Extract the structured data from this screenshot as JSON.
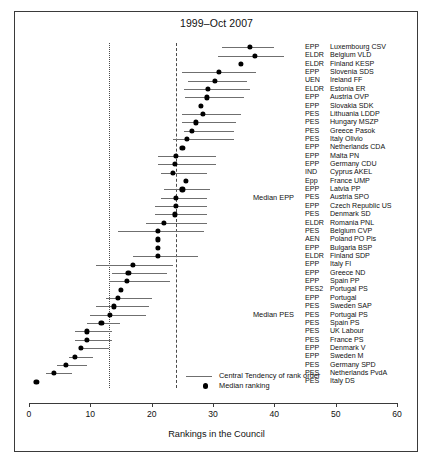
{
  "chart_data": {
    "type": "scatter",
    "title": "1999–Oct 2007",
    "xlabel": "Rankings in the Council",
    "ylabel": "",
    "xlim": [
      0,
      60
    ],
    "xticks": [
      0,
      10,
      20,
      30,
      40,
      50,
      60
    ],
    "grid": false,
    "legend_position": "bottom-center",
    "legend": [
      {
        "marker": "line",
        "label": "Central Tendency of rank order"
      },
      {
        "marker": "dot",
        "label": "Median ranking"
      }
    ],
    "reference_lines": [
      {
        "name": "Median PES",
        "value": 13,
        "style": "dotted"
      },
      {
        "name": "Median EPP",
        "value": 24,
        "style": "dashed"
      }
    ],
    "annotations": [
      {
        "text": "Median EPP",
        "row_index": 18
      },
      {
        "text": "Median PES",
        "row_index": 32
      }
    ],
    "series_names": [
      "Median ranking",
      "Central Tendency of rank order"
    ],
    "rows": [
      {
        "group": "EPP",
        "name": "Luxembourg CSV",
        "median": 36.0,
        "low": 31.5,
        "high": 40.0
      },
      {
        "group": "ELDR",
        "name": "Belgium VLD",
        "median": 36.8,
        "low": 30.8,
        "high": 41.5
      },
      {
        "group": "ELDR",
        "name": "Finland KESP",
        "median": 34.5,
        "low": 34.5,
        "high": 34.5
      },
      {
        "group": "EPP",
        "name": "Slovenia SDS",
        "median": 31.0,
        "low": 25.0,
        "high": 37.0
      },
      {
        "group": "UEN",
        "name": "Ireland FF",
        "median": 30.3,
        "low": 26.0,
        "high": 35.5
      },
      {
        "group": "ELDR",
        "name": "Estonia ER",
        "median": 29.2,
        "low": 25.2,
        "high": 36.0
      },
      {
        "group": "EPP",
        "name": "Austria OVP",
        "median": 29.0,
        "low": 25.5,
        "high": 35.0
      },
      {
        "group": "EPP",
        "name": "Slovakia SDK",
        "median": 28.0,
        "low": 28.0,
        "high": 28.0
      },
      {
        "group": "PES",
        "name": "Lithuania LDDP",
        "median": 28.3,
        "low": 25.0,
        "high": 34.5
      },
      {
        "group": "PES",
        "name": "Hungary MSZP",
        "median": 27.2,
        "low": 25.0,
        "high": 33.8
      },
      {
        "group": "PES",
        "name": "Greece Pasok",
        "median": 26.6,
        "low": 25.2,
        "high": 33.5
      },
      {
        "group": "PES",
        "name": "Italy Olivio",
        "median": 25.8,
        "low": 23.5,
        "high": 33.5
      },
      {
        "group": "EPP",
        "name": "Netherlands CDA",
        "median": 25.0,
        "low": 25.0,
        "high": 25.0
      },
      {
        "group": "EPP",
        "name": "Malta PN",
        "median": 24.0,
        "low": 21.0,
        "high": 30.5
      },
      {
        "group": "EPP",
        "name": "Germany CDU",
        "median": 23.8,
        "low": 21.0,
        "high": 30.5
      },
      {
        "group": "IND",
        "name": "Cyprus AKEL",
        "median": 23.4,
        "low": 21.5,
        "high": 29.0
      },
      {
        "group": "Epp",
        "name": "France UMP",
        "median": 25.6,
        "low": 25.6,
        "high": 25.6
      },
      {
        "group": "EPP",
        "name": "Latvia PP",
        "median": 25.0,
        "low": 22.0,
        "high": 29.5
      },
      {
        "group": "PES",
        "name": "Austria SPO",
        "median": 24.0,
        "low": 21.5,
        "high": 29.0
      },
      {
        "group": "EPP",
        "name": "Czech Republic US",
        "median": 24.0,
        "low": 20.5,
        "high": 29.0
      },
      {
        "group": "PES",
        "name": "Denmark SD",
        "median": 23.8,
        "low": 20.5,
        "high": 29.0
      },
      {
        "group": "ELDR",
        "name": "Romania PNL",
        "median": 22.0,
        "low": 19.0,
        "high": 29.0
      },
      {
        "group": "PES",
        "name": "Belgium CVP",
        "median": 21.0,
        "low": 14.5,
        "high": 28.5
      },
      {
        "group": "AEN",
        "name": "Poland PO Pis",
        "median": 21.0,
        "low": 21.0,
        "high": 21.0
      },
      {
        "group": "EPP",
        "name": "Bulgaria BSP",
        "median": 21.0,
        "low": 21.0,
        "high": 21.0
      },
      {
        "group": "ELDR",
        "name": "Finland SDP",
        "median": 21.0,
        "low": 17.0,
        "high": 27.5
      },
      {
        "group": "EPP",
        "name": "Italy FI",
        "median": 17.0,
        "low": 11.0,
        "high": 23.5
      },
      {
        "group": "EPP",
        "name": "Greece ND",
        "median": 16.2,
        "low": 13.5,
        "high": 22.5
      },
      {
        "group": "EPP",
        "name": "Spain PP",
        "median": 16.0,
        "low": 13.0,
        "high": 23.0
      },
      {
        "group": "PES2",
        "name": "Portugal PS",
        "median": 15.0,
        "low": 15.0,
        "high": 15.0
      },
      {
        "group": "EPP",
        "name": "Portugal",
        "median": 14.5,
        "low": 12.5,
        "high": 20.0
      },
      {
        "group": "PES",
        "name": "Sweden SAP",
        "median": 13.8,
        "low": 11.0,
        "high": 19.5
      },
      {
        "group": "PES",
        "name": "Portugal PS",
        "median": 13.2,
        "low": 10.0,
        "high": 19.0
      },
      {
        "group": "PES",
        "name": "Spain PS",
        "median": 11.8,
        "low": 9.5,
        "high": 14.8
      },
      {
        "group": "PES",
        "name": "UK Labour",
        "median": 9.5,
        "low": 7.5,
        "high": 13.5
      },
      {
        "group": "PES",
        "name": "France PS",
        "median": 9.5,
        "low": 7.5,
        "high": 13.5
      },
      {
        "group": "EPP",
        "name": "Denmark V",
        "median": 8.5,
        "low": 8.5,
        "high": 13.0
      },
      {
        "group": "EPP",
        "name": "Sweden M",
        "median": 7.5,
        "low": 6.5,
        "high": 10.5
      },
      {
        "group": "PES",
        "name": "Germany SPD",
        "median": 6.0,
        "low": 4.5,
        "high": 9.5
      },
      {
        "group": "PES",
        "name": "Netherlands PvdA",
        "median": 4.0,
        "low": 2.8,
        "high": 7.0
      },
      {
        "group": "PES",
        "name": "Italy DS",
        "median": 1.2,
        "low": 1.2,
        "high": 1.2
      }
    ]
  }
}
